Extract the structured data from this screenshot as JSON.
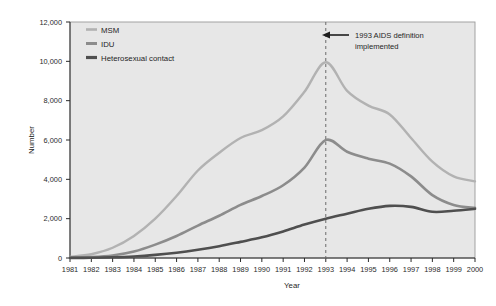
{
  "chart_data": {
    "type": "line",
    "title": "",
    "xlabel": "Year",
    "ylabel": "Number",
    "xlim": [
      1981,
      2000
    ],
    "ylim": [
      0,
      12000
    ],
    "grid": false,
    "legend_position": "top-left",
    "categories": [
      1981,
      1982,
      1983,
      1984,
      1985,
      1986,
      1987,
      1988,
      1989,
      1990,
      1991,
      1992,
      1993,
      1994,
      1995,
      1996,
      1997,
      1998,
      1999,
      2000
    ],
    "x_tick_labels": [
      "1981",
      "1982",
      "1983",
      "1984",
      "1985",
      "1986",
      "1987",
      "1988",
      "1989",
      "1990",
      "1991",
      "1992",
      "1993",
      "1994",
      "1995",
      "1996",
      "1997",
      "1998",
      "1999",
      "2000"
    ],
    "y_tick_labels": [
      "0",
      "2,000",
      "4,000",
      "6,000",
      "8,000",
      "10,000",
      "12,000"
    ],
    "y_ticks": [
      0,
      2000,
      4000,
      6000,
      8000,
      10000,
      12000
    ],
    "series": [
      {
        "name": "MSM",
        "color": "#b2b2b2",
        "values": [
          60,
          190,
          520,
          1120,
          2000,
          3150,
          4450,
          5350,
          6100,
          6500,
          7200,
          8450,
          9950,
          8500,
          7750,
          7300,
          6100,
          4900,
          4150,
          3900
        ]
      },
      {
        "name": "IDU",
        "color": "#8c8c8c",
        "values": [
          15,
          45,
          130,
          330,
          680,
          1120,
          1650,
          2150,
          2700,
          3150,
          3700,
          4600,
          6000,
          5400,
          5050,
          4800,
          4150,
          3200,
          2700,
          2550
        ]
      },
      {
        "name": "Heterosexual contact",
        "color": "#4f4f4f",
        "values": [
          5,
          12,
          35,
          80,
          160,
          270,
          420,
          600,
          820,
          1050,
          1350,
          1700,
          2000,
          2250,
          2500,
          2650,
          2600,
          2350,
          2400,
          2500
        ]
      }
    ],
    "annotations": [
      {
        "type": "vline",
        "x": 1993,
        "style": "dashed",
        "color": "#6b6b6b"
      },
      {
        "type": "text-arrow",
        "text_line_1": "1993 AIDS definition",
        "text_line_2": "implemented",
        "arrow": "left-arrow"
      }
    ]
  },
  "legend": {
    "items": [
      {
        "label": "MSM"
      },
      {
        "label": "IDU"
      },
      {
        "label": "Heterosexual contact"
      }
    ]
  },
  "axes": {
    "x_title": "Year",
    "y_title": "Number"
  },
  "colors": {
    "plot_background": "#e7e7e7",
    "plot_border": "#9a9a9a",
    "axis": "#2b2b2b",
    "text": "#1f1f1f"
  }
}
